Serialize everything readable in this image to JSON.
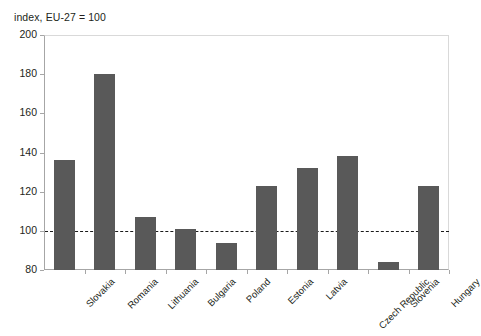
{
  "chart_data": {
    "type": "bar",
    "title": "index, EU-27 = 100",
    "xlabel": "",
    "ylabel": "",
    "ylim": [
      80,
      200
    ],
    "ytick_step": 20,
    "yticks": [
      200,
      180,
      160,
      140,
      120,
      100,
      80
    ],
    "grid": false,
    "legend": "none",
    "bar_color": "#595959",
    "reference_line": {
      "value": 100,
      "style": "dashed",
      "color": "#1a1a1a",
      "label": ""
    },
    "categories": [
      "Slovakia",
      "Romania",
      "Lithuania",
      "Bulgaria",
      "Poland",
      "Estonia",
      "Latvia",
      "Czech Republic",
      "Slovenia",
      "Hungary"
    ],
    "values": [
      136,
      180,
      107,
      101,
      94,
      123,
      132,
      138,
      84,
      123
    ]
  }
}
